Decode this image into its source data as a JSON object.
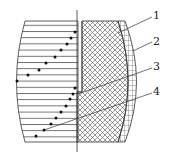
{
  "diagram": {
    "type": "cross-section schematic",
    "regions": [
      {
        "id": "left-hatched",
        "pattern": "horizontal-lines"
      },
      {
        "id": "center-crosshatch",
        "pattern": "diamond-crosshatch"
      },
      {
        "id": "outer-rim",
        "pattern": "grid"
      }
    ],
    "labels": [
      {
        "id": "1",
        "text": "1"
      },
      {
        "id": "2",
        "text": "2"
      },
      {
        "id": "3",
        "text": "3"
      },
      {
        "id": "4",
        "text": "4"
      }
    ],
    "dot_rows": {
      "upper": [
        [
          75,
          32
        ],
        [
          71,
          38
        ],
        [
          67,
          44
        ],
        [
          61,
          50
        ],
        [
          55,
          57
        ],
        [
          46,
          63
        ],
        [
          39,
          70
        ],
        [
          28,
          75
        ],
        [
          17,
          81
        ]
      ],
      "lower": [
        [
          75,
          88
        ],
        [
          73,
          94
        ],
        [
          70,
          99
        ],
        [
          66,
          106
        ],
        [
          61,
          112
        ],
        [
          56,
          118
        ],
        [
          51,
          124
        ],
        [
          44,
          130
        ],
        [
          36,
          136
        ]
      ]
    },
    "colors": {
      "line": "#333333",
      "background": "#ffffff"
    }
  }
}
